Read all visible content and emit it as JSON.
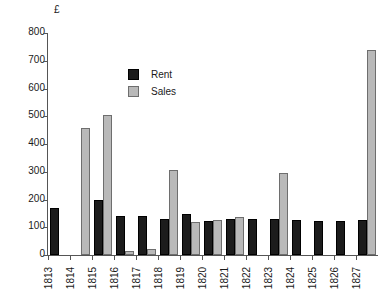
{
  "chart_data": {
    "type": "bar",
    "title": "",
    "subtitle": "",
    "xlabel": "",
    "ylabel": "£",
    "ylim": [
      0,
      800
    ],
    "ytick_step": 100,
    "yticks": [
      800,
      700,
      600,
      500,
      400,
      300,
      200,
      100,
      0
    ],
    "ytick_labels": [
      "800",
      "700",
      "600",
      "500",
      "400",
      "300",
      "200",
      "100",
      "0"
    ],
    "grid": false,
    "legend_position": "inside-upper-left",
    "categories": [
      "1813",
      "1814",
      "1815",
      "1816",
      "1817",
      "1818",
      "1819",
      "1820",
      "1821",
      "1822",
      "1823",
      "1824",
      "1825",
      "1826",
      "1827"
    ],
    "series": [
      {
        "name": "Rent",
        "color": "#1c1c1c",
        "values": [
          170,
          null,
          197,
          140,
          140,
          128,
          148,
          122,
          130,
          130,
          130,
          125,
          122,
          122,
          125
        ]
      },
      {
        "name": "Sales",
        "color": "#b9b9b9",
        "values": [
          null,
          457,
          505,
          15,
          22,
          306,
          118,
          125,
          137,
          null,
          295,
          null,
          null,
          null,
          740
        ]
      }
    ]
  },
  "legend": {
    "items": [
      {
        "label": "Rent",
        "swatch": "rent"
      },
      {
        "label": "Sales",
        "swatch": "sales"
      }
    ]
  },
  "axes": {
    "y_title": "£"
  }
}
